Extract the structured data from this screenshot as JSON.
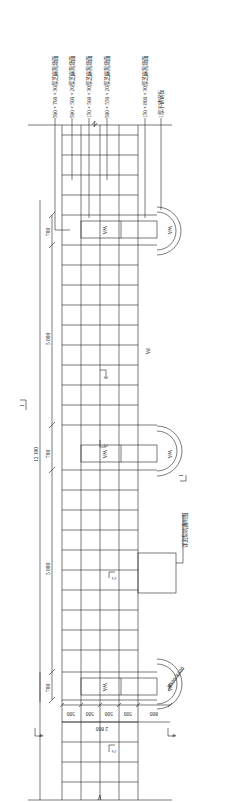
{
  "drawing": {
    "orientation": "rotated-90-clockwise",
    "stroke_color": "#222222",
    "background": "#ffffff"
  },
  "material_labels": [
    {
      "text": "500 × 700 × 30厚芝麻黑烧面",
      "x": 54
    },
    {
      "text": "500 × 500 × 20厚芝麻黑烧面",
      "x": 71
    },
    {
      "text": "150 × 500 × 30厚芝麻黑烧面",
      "x": 88
    },
    {
      "text": "500 × 550 × 20厚芝麻黑烧面",
      "x": 106
    },
    {
      "text": "150 × 800 × 30厚芝麻黑烧面",
      "x": 144
    },
    {
      "text": "1厚不锈钢板",
      "x": 160
    }
  ],
  "pit_note": "详见泵坑通用图",
  "area_label": "PA",
  "pit_label": "WA",
  "circle_radius_label": "R500/R600",
  "dimensions": {
    "overall": "12 100",
    "pit_width": "700",
    "span": "5 000",
    "bottom_overall": "2 800",
    "bottom_segments": [
      "500",
      "500",
      "500",
      "500",
      "800"
    ]
  },
  "section_marks": {
    "s1": "1",
    "s2": "2",
    "s3": "3",
    "s4": "4"
  }
}
